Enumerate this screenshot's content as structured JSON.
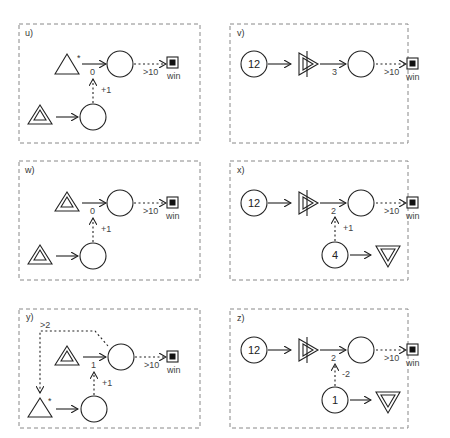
{
  "panels": [
    {
      "id": "u",
      "label": "u)",
      "edge_main": "0",
      "edge_mod": "+1",
      "win_cond": ">10",
      "win": "win"
    },
    {
      "id": "v",
      "label": "v)",
      "source": "12",
      "edge_main": "3",
      "win_cond": ">10",
      "win": "win"
    },
    {
      "id": "w",
      "label": "w)",
      "edge_main": "0",
      "edge_mod": "+1",
      "win_cond": ">10",
      "win": "win"
    },
    {
      "id": "x",
      "label": "x)",
      "source": "12",
      "edge_main": "2",
      "edge_mod": "+1",
      "pool2": "4",
      "win_cond": ">10",
      "win": "win"
    },
    {
      "id": "y",
      "label": "y)",
      "edge_main": "1",
      "edge_mod": "+1",
      "trigger": ">2",
      "win_cond": ">10",
      "win": "win"
    },
    {
      "id": "z",
      "label": "z)",
      "source": "12",
      "edge_main": "2",
      "edge_mod": "-2",
      "pool2": "1",
      "win_cond": ">10",
      "win": "win"
    }
  ],
  "symbols": {
    "star": "*"
  }
}
